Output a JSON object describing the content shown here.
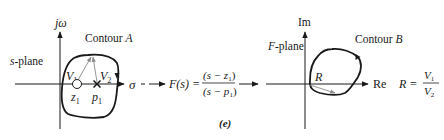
{
  "s_plane": {
    "plane_label_var": "s",
    "plane_label_rest": "-plane",
    "vertical_axis_label": "jω",
    "horizontal_axis_label": "σ",
    "contour_label_text": "Contour ",
    "contour_label_var": "A",
    "vector_1": "V",
    "vector_1_sub": "1",
    "vector_2": "V",
    "vector_2_sub": "2",
    "zero_label": "z",
    "zero_sub": "1",
    "pole_label": "p",
    "pole_sub": "1"
  },
  "mapping": {
    "function_lhs": "F(s) =",
    "numerator": "(s − z",
    "numerator_sub": "1",
    "numerator_close": ")",
    "denominator": "(s − p",
    "denominator_sub": "1",
    "denominator_close": ")"
  },
  "f_plane": {
    "plane_label_var": "F",
    "plane_label_rest": "-plane",
    "vertical_axis_label": "Im",
    "horizontal_axis_label": "Re",
    "contour_label_text": "Contour ",
    "contour_label_var": "B",
    "resultant_label": "R",
    "ratio_lhs": "R =",
    "ratio_num": "V",
    "ratio_num_sub": "1",
    "ratio_den": "V",
    "ratio_den_sub": "2"
  },
  "caption": "(e)",
  "colors": {
    "ink": "#1a1a1a",
    "vector_gray": "#8a8a8a"
  }
}
